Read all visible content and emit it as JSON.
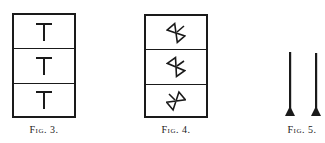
{
  "figures": [
    {
      "id": "fig3",
      "caption": "Fig. 3.",
      "cells": [
        {
          "symbol": "T-glyph"
        },
        {
          "symbol": "T-glyph"
        },
        {
          "symbol": "T-glyph"
        }
      ]
    },
    {
      "id": "fig4",
      "caption": "Fig. 4.",
      "cells": [
        {
          "symbol": "rotated-hourglass-glyph"
        },
        {
          "symbol": "rotated-hourglass-glyph"
        },
        {
          "symbol": "rotated-hourglass-glyph"
        }
      ]
    },
    {
      "id": "fig5",
      "caption": "Fig. 5.",
      "items": [
        {
          "symbol": "pin-with-triangular-base"
        },
        {
          "symbol": "pin-with-triangular-base"
        }
      ]
    }
  ],
  "colors": {
    "ink": "#1a1a1a",
    "paper": "#ffffff"
  }
}
